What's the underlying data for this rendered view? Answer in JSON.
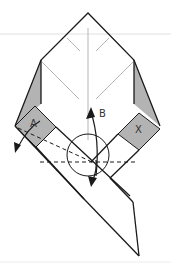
{
  "diagram": {
    "type": "origami-fold-instruction",
    "labels": {
      "a": "A",
      "b": "B",
      "x": "X"
    },
    "colors": {
      "background": "#ffffff",
      "outline": "#1a1a1a",
      "crease": "#b5b5b5",
      "shaded": "#b3b3b3",
      "guide_line": "#e0e0e0"
    },
    "elements": [
      "paper-outline",
      "shaded-left-flap",
      "shaded-right-flap",
      "square-a",
      "square-x",
      "crease-lines",
      "rotation-circle",
      "arrow-b",
      "arrow-left-down",
      "arrow-down",
      "dashed-fold-lines"
    ]
  }
}
